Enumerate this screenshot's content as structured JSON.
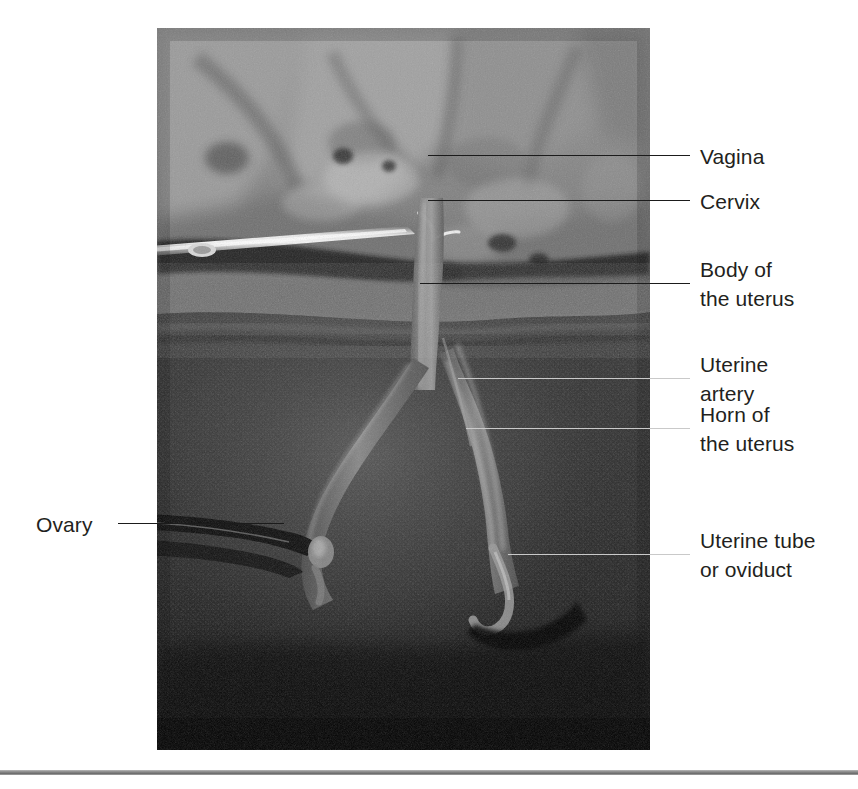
{
  "figure": {
    "kind": "labelled-anatomical-photograph",
    "photo": {
      "left": 157,
      "top": 28,
      "width": 493,
      "height": 722
    },
    "label_color": "#231f20",
    "leader_color": "#1b1b1b",
    "leader_color_light": "#c9c9c9",
    "rule_color": "#8d8d8d",
    "background": "#ffffff"
  },
  "labels": [
    {
      "id": "vagina",
      "text": "Vagina",
      "side": "right",
      "text_left": 700,
      "text_top": 142,
      "leader": {
        "left": 428,
        "top": 155,
        "width": 262,
        "tone": "dark"
      }
    },
    {
      "id": "cervix",
      "text": "Cervix",
      "side": "right",
      "text_left": 700,
      "text_top": 187,
      "leader": {
        "left": 428,
        "top": 200,
        "width": 262,
        "tone": "dark"
      }
    },
    {
      "id": "body-of-the-uterus",
      "text": "Body of\nthe uterus",
      "side": "right",
      "text_left": 700,
      "text_top": 255,
      "leader": {
        "left": 420,
        "top": 283,
        "width": 270,
        "tone": "dark"
      }
    },
    {
      "id": "uterine-artery",
      "text": "Uterine\nartery",
      "side": "right",
      "text_left": 700,
      "text_top": 350,
      "leader": {
        "left": 458,
        "top": 378,
        "width": 232,
        "tone": "light"
      }
    },
    {
      "id": "horn-of-the-uterus",
      "text": "Horn of\nthe uterus",
      "side": "right",
      "text_left": 700,
      "text_top": 400,
      "leader": {
        "left": 466,
        "top": 428,
        "width": 224,
        "tone": "light"
      }
    },
    {
      "id": "uterine-tube-or-oviduct",
      "text": "Uterine tube\nor oviduct",
      "side": "right",
      "text_left": 700,
      "text_top": 526,
      "leader": {
        "left": 508,
        "top": 554,
        "width": 182,
        "tone": "light"
      }
    },
    {
      "id": "ovary",
      "text": "Ovary",
      "side": "left",
      "text_left": 36,
      "text_top": 510,
      "leader": {
        "left": 118,
        "top": 523,
        "width": 166,
        "tone": "dark"
      }
    }
  ]
}
